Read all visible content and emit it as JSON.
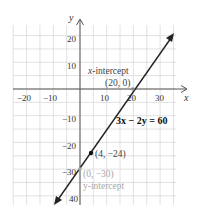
{
  "chart_data": {
    "type": "line",
    "title": "",
    "xlabel": "x",
    "ylabel": "y",
    "xlim": [
      -25,
      36
    ],
    "ylim": [
      -44,
      24
    ],
    "grid": true,
    "grid_step": 5,
    "x_ticks": [
      -20,
      -10,
      10,
      20,
      30
    ],
    "y_ticks": [
      20,
      10,
      -10,
      -20,
      -30,
      -40
    ],
    "x_tick_labels": [
      "−20",
      "−10",
      "10",
      "20",
      "30"
    ],
    "y_tick_labels": [
      "20",
      "10",
      "−10",
      "−20",
      "−30",
      "40"
    ],
    "series": [
      {
        "name": "3x − 2y = 60",
        "equation": "3x - 2y = 60",
        "slope": 1.5,
        "y_intercept": -30,
        "x": [
          -10,
          35.3
        ],
        "y": [
          -45,
          23
        ],
        "arrows": "both",
        "color": "#222222"
      }
    ],
    "points": [
      {
        "x": 20,
        "y": 0,
        "label": "(20, 0)",
        "annotation": "x-intercept"
      },
      {
        "x": 4,
        "y": -24,
        "label": "(4, −24)",
        "marker": "filled-dot"
      },
      {
        "x": 0,
        "y": -30,
        "label": "(0, −30)",
        "annotation": "y-intercept"
      }
    ],
    "annotations": [
      "x-intercept",
      "(20, 0)",
      "3x − 2y = 60",
      "(4, −24)",
      "(0, −30)",
      "y-intercept"
    ]
  },
  "labels": {
    "x_axis": "x",
    "y_axis": "y",
    "x_intercept_title_var": "x",
    "x_intercept_title_rest": "-intercept",
    "x_intercept_point": "(20, 0)",
    "equation": "3x − 2y = 60",
    "point_label": "(4, −24)",
    "y_intercept_point": "(0, −30)",
    "y_intercept_title": "y-intercept"
  },
  "colors": {
    "grid": "#d9d9d9",
    "axis": "#555555",
    "line": "#222222",
    "annotation_gray": "#a8a8a8"
  }
}
